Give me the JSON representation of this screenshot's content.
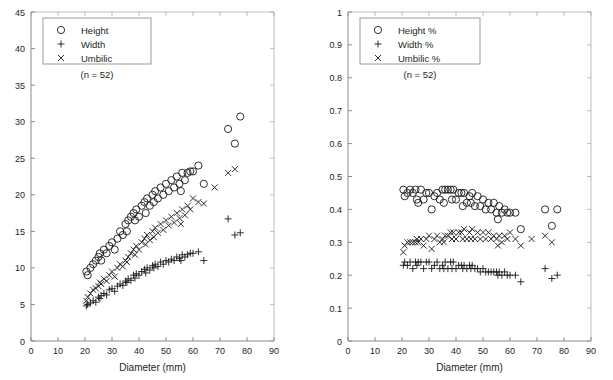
{
  "figure": {
    "background_color": "#ffffff",
    "axis_color": "#8a8a8a",
    "marker_color": "#1a1a1a",
    "text_color": "#231f20",
    "panel_count": 2
  },
  "chart_data": [
    {
      "type": "scatter",
      "panel": "left",
      "title": "",
      "xlabel": "Diameter (mm)",
      "ylabel": "",
      "xlim": [
        0,
        90
      ],
      "ylim": [
        0,
        45
      ],
      "xticks": [
        0,
        10,
        20,
        30,
        40,
        50,
        60,
        70,
        80,
        90
      ],
      "yticks": [
        0,
        5,
        10,
        15,
        20,
        25,
        30,
        35,
        40,
        45
      ],
      "grid": false,
      "legend_position": "upper-left",
      "annotation": "(n = 52)",
      "legend": [
        "Height",
        "Width",
        "Umbilic"
      ],
      "series": [
        {
          "name": "Height",
          "marker": "circle",
          "x": [
            20.5,
            21.0,
            22.0,
            23.0,
            24.0,
            25.0,
            25.5,
            26.0,
            27.0,
            28.0,
            29.0,
            30.0,
            31.0,
            32.0,
            33.0,
            34.0,
            35.0,
            35.5,
            36.0,
            37.0,
            38.0,
            38.5,
            39.0,
            40.0,
            41.0,
            42.0,
            42.5,
            43.0,
            44.0,
            45.0,
            45.5,
            46.0,
            47.0,
            48.0,
            49.0,
            50.0,
            51.0,
            52.0,
            53.0,
            54.0,
            55.0,
            55.5,
            56.0,
            57.0,
            58.0,
            59.0,
            60.0,
            62.0,
            64.0,
            73.0,
            75.5,
            77.5
          ],
          "y": [
            9.5,
            9.0,
            10.0,
            10.5,
            11.0,
            11.5,
            12.0,
            11.0,
            12.5,
            12.0,
            13.0,
            13.5,
            12.5,
            14.0,
            15.0,
            14.5,
            16.0,
            15.0,
            16.5,
            17.0,
            17.5,
            16.5,
            18.0,
            17.0,
            18.5,
            19.0,
            17.5,
            19.5,
            18.5,
            20.0,
            19.0,
            20.5,
            19.5,
            21.0,
            20.0,
            21.5,
            20.5,
            22.0,
            21.0,
            22.5,
            21.5,
            20.5,
            23.0,
            22.0,
            23.0,
            23.2,
            23.2,
            24.0,
            21.5,
            29.0,
            27.0,
            30.7
          ]
        },
        {
          "name": "Width",
          "marker": "plus",
          "x": [
            20.5,
            21.0,
            22.0,
            23.0,
            24.0,
            25.0,
            25.5,
            26.0,
            27.0,
            28.0,
            29.0,
            30.0,
            31.0,
            32.0,
            33.0,
            34.0,
            35.0,
            35.5,
            36.0,
            37.0,
            38.0,
            38.5,
            39.0,
            40.0,
            41.0,
            42.0,
            42.5,
            43.0,
            44.0,
            45.0,
            45.5,
            46.0,
            47.0,
            48.0,
            49.0,
            50.0,
            51.0,
            52.0,
            53.0,
            54.0,
            55.0,
            55.5,
            56.0,
            57.0,
            58.0,
            59.0,
            60.0,
            62.0,
            64.0,
            73.0,
            75.5,
            77.5
          ],
          "y": [
            4.8,
            5.0,
            5.2,
            5.5,
            5.3,
            6.0,
            5.8,
            6.2,
            6.5,
            6.3,
            7.0,
            7.2,
            6.8,
            7.5,
            7.8,
            7.6,
            8.2,
            8.0,
            8.5,
            8.3,
            9.0,
            8.6,
            9.2,
            9.0,
            9.5,
            9.8,
            9.3,
            10.0,
            9.7,
            10.3,
            10.0,
            10.5,
            10.2,
            10.8,
            10.5,
            11.0,
            10.8,
            11.2,
            11.0,
            11.5,
            11.3,
            11.0,
            11.8,
            11.5,
            11.8,
            12.0,
            12.0,
            12.2,
            11.0,
            16.7,
            14.5,
            14.8
          ]
        },
        {
          "name": "Umbilic",
          "marker": "cross",
          "x": [
            20.5,
            21.0,
            22.0,
            23.0,
            24.0,
            25.0,
            25.5,
            26.0,
            27.0,
            28.0,
            29.0,
            30.0,
            31.0,
            32.0,
            33.0,
            34.0,
            35.0,
            35.5,
            36.0,
            37.0,
            38.0,
            38.5,
            39.0,
            40.0,
            41.0,
            42.0,
            42.5,
            43.0,
            44.0,
            45.0,
            45.5,
            46.0,
            47.0,
            48.0,
            49.0,
            50.0,
            51.0,
            52.0,
            53.0,
            54.0,
            55.0,
            55.5,
            56.0,
            57.0,
            58.0,
            59.0,
            60.0,
            62.0,
            64.0,
            68.0,
            73.0,
            75.5
          ],
          "y": [
            5.5,
            6.0,
            6.5,
            7.0,
            7.2,
            7.5,
            8.0,
            7.8,
            8.5,
            8.2,
            9.0,
            9.5,
            8.8,
            10.0,
            10.5,
            10.2,
            11.0,
            10.8,
            11.5,
            12.0,
            12.5,
            11.8,
            13.0,
            12.5,
            13.5,
            14.0,
            13.2,
            14.5,
            13.8,
            15.0,
            14.2,
            15.5,
            14.8,
            16.0,
            15.2,
            16.5,
            15.8,
            17.0,
            16.2,
            17.5,
            16.8,
            16.0,
            18.0,
            17.2,
            18.5,
            18.0,
            19.5,
            19.0,
            18.8,
            21.0,
            23.0,
            23.5
          ]
        }
      ]
    },
    {
      "type": "scatter",
      "panel": "right",
      "title": "",
      "xlabel": "Diameter (mm)",
      "ylabel": "",
      "xlim": [
        0,
        90
      ],
      "ylim": [
        0,
        1
      ],
      "xticks": [
        0,
        10,
        20,
        30,
        40,
        50,
        60,
        70,
        80,
        90
      ],
      "yticks": [
        0,
        0.1,
        0.2,
        0.3,
        0.4,
        0.5,
        0.6,
        0.7,
        0.8,
        0.9,
        1
      ],
      "grid": false,
      "legend_position": "upper-left",
      "annotation": "(n = 52)",
      "legend": [
        "Height %",
        "Width %",
        "Umbilic %"
      ],
      "series": [
        {
          "name": "Height %",
          "marker": "circle",
          "x": [
            20.5,
            21.0,
            22.0,
            23.0,
            24.0,
            25.0,
            25.5,
            26.0,
            27.0,
            28.0,
            29.0,
            30.0,
            31.0,
            32.0,
            33.0,
            34.0,
            35.0,
            35.5,
            36.0,
            37.0,
            38.0,
            38.5,
            39.0,
            40.0,
            41.0,
            42.0,
            42.5,
            43.0,
            44.0,
            45.0,
            45.5,
            46.0,
            47.0,
            48.0,
            49.0,
            50.0,
            51.0,
            52.0,
            53.0,
            54.0,
            55.0,
            55.5,
            56.0,
            57.0,
            58.0,
            59.0,
            60.0,
            62.0,
            64.0,
            73.0,
            75.5,
            77.5
          ],
          "y": [
            0.46,
            0.44,
            0.45,
            0.46,
            0.45,
            0.46,
            0.43,
            0.42,
            0.46,
            0.43,
            0.45,
            0.45,
            0.4,
            0.44,
            0.45,
            0.43,
            0.46,
            0.42,
            0.46,
            0.46,
            0.46,
            0.43,
            0.46,
            0.43,
            0.45,
            0.45,
            0.41,
            0.45,
            0.42,
            0.44,
            0.42,
            0.45,
            0.41,
            0.44,
            0.41,
            0.43,
            0.4,
            0.42,
            0.4,
            0.42,
            0.39,
            0.37,
            0.41,
            0.39,
            0.4,
            0.39,
            0.39,
            0.39,
            0.34,
            0.4,
            0.35,
            0.4
          ]
        },
        {
          "name": "Width %",
          "marker": "plus",
          "x": [
            20.5,
            21.0,
            22.0,
            23.0,
            24.0,
            25.0,
            25.5,
            26.0,
            27.0,
            28.0,
            29.0,
            30.0,
            31.0,
            32.0,
            33.0,
            34.0,
            35.0,
            35.5,
            36.0,
            37.0,
            38.0,
            38.5,
            39.0,
            40.0,
            41.0,
            42.0,
            42.5,
            43.0,
            44.0,
            45.0,
            45.5,
            46.0,
            47.0,
            48.0,
            49.0,
            50.0,
            51.0,
            52.0,
            53.0,
            54.0,
            55.0,
            55.5,
            56.0,
            57.0,
            58.0,
            59.0,
            60.0,
            62.0,
            64.0,
            73.0,
            75.5,
            77.5
          ],
          "y": [
            0.23,
            0.24,
            0.23,
            0.24,
            0.22,
            0.24,
            0.23,
            0.24,
            0.24,
            0.22,
            0.24,
            0.24,
            0.22,
            0.23,
            0.24,
            0.22,
            0.23,
            0.22,
            0.24,
            0.22,
            0.24,
            0.22,
            0.24,
            0.22,
            0.23,
            0.23,
            0.22,
            0.23,
            0.22,
            0.23,
            0.22,
            0.23,
            0.22,
            0.22,
            0.21,
            0.22,
            0.21,
            0.21,
            0.21,
            0.21,
            0.21,
            0.2,
            0.21,
            0.2,
            0.21,
            0.2,
            0.2,
            0.2,
            0.18,
            0.22,
            0.19,
            0.2
          ]
        },
        {
          "name": "Umbilic %",
          "marker": "cross",
          "x": [
            20.5,
            21.0,
            22.0,
            23.0,
            24.0,
            25.0,
            25.5,
            26.0,
            27.0,
            28.0,
            29.0,
            30.0,
            31.0,
            32.0,
            33.0,
            34.0,
            35.0,
            35.5,
            36.0,
            37.0,
            38.0,
            38.5,
            39.0,
            40.0,
            41.0,
            42.0,
            42.5,
            43.0,
            44.0,
            45.0,
            45.5,
            46.0,
            47.0,
            48.0,
            49.0,
            50.0,
            51.0,
            52.0,
            53.0,
            54.0,
            55.0,
            55.5,
            56.0,
            57.0,
            58.0,
            59.0,
            60.0,
            62.0,
            64.0,
            68.0,
            73.0,
            75.5
          ],
          "y": [
            0.27,
            0.29,
            0.3,
            0.3,
            0.3,
            0.3,
            0.31,
            0.3,
            0.31,
            0.29,
            0.31,
            0.32,
            0.28,
            0.31,
            0.32,
            0.3,
            0.31,
            0.3,
            0.32,
            0.32,
            0.33,
            0.31,
            0.33,
            0.31,
            0.33,
            0.33,
            0.31,
            0.34,
            0.31,
            0.33,
            0.31,
            0.34,
            0.31,
            0.33,
            0.31,
            0.33,
            0.31,
            0.33,
            0.31,
            0.32,
            0.31,
            0.29,
            0.32,
            0.3,
            0.32,
            0.31,
            0.33,
            0.31,
            0.29,
            0.31,
            0.32,
            0.3
          ]
        }
      ]
    }
  ]
}
